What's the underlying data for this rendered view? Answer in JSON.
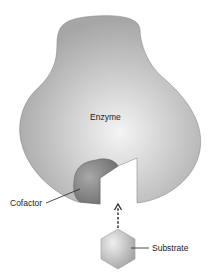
{
  "diagram": {
    "type": "enzyme-cofactor-substrate schematic",
    "labels": {
      "enzyme": "Enzyme",
      "cofactor": "Cofactor",
      "substrate": "Substrate"
    },
    "colors": {
      "enzyme_fill_center": "#f2f2f2",
      "enzyme_fill_edge": "#a9a9a9",
      "cofactor_fill": "#8c8c8c",
      "substrate_fill": "#c4c4c4",
      "line": "#333333"
    },
    "arrow": {
      "style": "dashed",
      "direction": "up",
      "from": "substrate",
      "to": "active-site"
    }
  }
}
